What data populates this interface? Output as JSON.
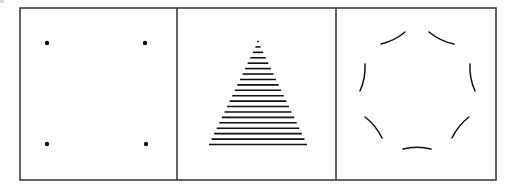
{
  "figure": {
    "frame": {
      "x": 20,
      "y": 8,
      "width": 476,
      "height": 172,
      "stroke": "#333333",
      "stroke_width": 1.5
    },
    "dividers": [
      177,
      336
    ],
    "colors": {
      "ink": "#111111",
      "frame": "#333333",
      "background": "#ffffff"
    },
    "panels": [
      {
        "id": "dots",
        "label": "four-dots",
        "dots": [
          {
            "cx": 47,
            "cy": 43
          },
          {
            "cx": 145,
            "cy": 43
          },
          {
            "cx": 47,
            "cy": 144
          },
          {
            "cx": 146,
            "cy": 144
          }
        ],
        "dot_radius": 2.2
      },
      {
        "id": "triangle",
        "label": "striped-triangle",
        "apex": {
          "x": 258,
          "y": 41.5
        },
        "base": {
          "x1": 209,
          "x2": 307,
          "y": 144.5
        },
        "line_count": 20,
        "stroke_width": 1.6
      },
      {
        "id": "circle",
        "label": "dashed-circle",
        "center": {
          "x": 417,
          "y": 91
        },
        "radius": 58,
        "arcs": [
          {
            "name": "top-left",
            "x1": 381,
            "y1": 44,
            "x2": 405,
            "y2": 32
          },
          {
            "name": "top-right",
            "x1": 429,
            "y1": 32,
            "x2": 454,
            "y2": 44
          },
          {
            "name": "left",
            "x1": 365,
            "y1": 64,
            "x2": 360,
            "y2": 91
          },
          {
            "name": "right",
            "x1": 470,
            "y1": 64,
            "x2": 475,
            "y2": 91
          },
          {
            "name": "lower-left",
            "x1": 365,
            "y1": 117,
            "x2": 382,
            "y2": 138
          },
          {
            "name": "lower-right",
            "x1": 469,
            "y1": 117,
            "x2": 452,
            "y2": 138
          },
          {
            "name": "bottom",
            "x1": 403,
            "y1": 149,
            "x2": 431,
            "y2": 149
          }
        ],
        "stroke_width": 1.5
      }
    ]
  }
}
